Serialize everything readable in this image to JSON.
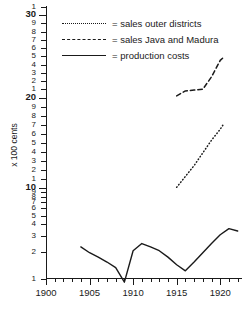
{
  "chart_data": {
    "type": "line",
    "title": "",
    "xlabel": "",
    "ylabel": "x 100 cents",
    "xlim": [
      1900,
      1922.5
    ],
    "ylim": [
      1,
      31
    ],
    "yscale": "log-segmented",
    "grid": false,
    "legend_position": "top-right-inside",
    "x_tick_labels": [
      "1900",
      "1905",
      "1910",
      "1915",
      "1920"
    ],
    "x_tick_values": [
      1900,
      1905,
      1910,
      1915,
      1920
    ],
    "x_minor_tick_interval": 1,
    "y_tick_labels": [
      "1",
      "2",
      "3",
      "4",
      "5",
      "6",
      "7",
      "8",
      "9",
      "10",
      "1",
      "2",
      "3",
      "4",
      "5",
      "6",
      "7",
      "8",
      "9",
      "20",
      "1",
      "2",
      "3",
      "4",
      "5",
      "6",
      "7",
      "8",
      "9",
      "30",
      "1"
    ],
    "y_tick_values": [
      1,
      2,
      3,
      4,
      5,
      6,
      7,
      8,
      9,
      10,
      11,
      12,
      13,
      14,
      15,
      16,
      17,
      18,
      19,
      20,
      21,
      22,
      23,
      24,
      25,
      26,
      27,
      28,
      29,
      30,
      31
    ],
    "y_major_tick_labels": [
      "10",
      "20",
      "30"
    ],
    "series": [
      {
        "name": "sales outer districts",
        "style": "dotted",
        "color": "#1a1a1a",
        "x": [
          1915,
          1916,
          1917,
          1918,
          1919,
          1920,
          1920.4
        ],
        "values": [
          10.0,
          11.2,
          12.4,
          13.8,
          15.2,
          16.4,
          17.0
        ]
      },
      {
        "name": "sales Java and Madura",
        "style": "dashed",
        "color": "#1a1a1a",
        "x": [
          1915,
          1916,
          1917,
          1918,
          1919,
          1920,
          1920.4
        ],
        "values": [
          20.1,
          20.7,
          20.8,
          20.9,
          22.4,
          24.4,
          24.8
        ]
      },
      {
        "name": "production costs",
        "style": "solid",
        "color": "#1a1a1a",
        "x": [
          1904,
          1905,
          1906,
          1907,
          1908,
          1909,
          1910,
          1911,
          1912,
          1913,
          1914,
          1915,
          1916,
          1917,
          1918,
          1919,
          1920,
          1921,
          1922
        ],
        "values": [
          2.2,
          1.9,
          1.7,
          1.5,
          1.3,
          0.9,
          2.0,
          2.4,
          2.2,
          2.0,
          1.7,
          1.4,
          1.2,
          1.5,
          1.9,
          2.4,
          3.0,
          3.5,
          3.3
        ]
      }
    ],
    "legend": [
      {
        "label": "= sales outer districts",
        "style": "dotted"
      },
      {
        "label": "= sales Java and Madura",
        "style": "dashed"
      },
      {
        "label": "= production costs",
        "style": "solid"
      }
    ]
  }
}
